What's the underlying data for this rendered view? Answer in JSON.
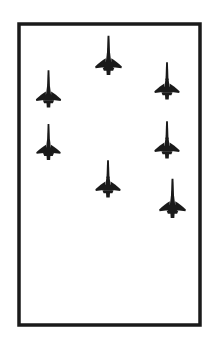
{
  "figure": {
    "description": "Black silhouettes of seven delta-wing interceptor aircraft with long nose probes, all oriented nose-up, arranged in a loose formation inside a rectangular ruled border. The lower portion of the frame is empty white space.",
    "background_color": "#ffffff",
    "ink_color": "#1a1a1a"
  },
  "border": {
    "name": "rectangular-frame",
    "x": 19,
    "y": 24,
    "width": 181,
    "height": 301,
    "stroke_width": 3.5,
    "color": "#1a1a1a"
  },
  "canvas": {
    "width": 219,
    "height": 353
  },
  "aircraft_symbol": {
    "type": "delta-wing-interceptor-silhouette",
    "features": [
      "nose-probe",
      "delta-wing",
      "fuselage",
      "tailplane"
    ],
    "nose_probe_fraction": 0.58,
    "color": "#1a1a1a"
  },
  "aircraft": [
    {
      "id": 1,
      "label": "aircraft-top-center",
      "column": "center",
      "cx": 108.5,
      "cy": 63.0,
      "scale": 1.06,
      "rotation": 0
    },
    {
      "id": 2,
      "label": "aircraft-upper-left",
      "column": "left",
      "cx": 48.5,
      "cy": 96.0,
      "scale": 1.0,
      "rotation": 0
    },
    {
      "id": 3,
      "label": "aircraft-upper-right",
      "column": "right",
      "cx": 167.0,
      "cy": 88.0,
      "scale": 1.0,
      "rotation": 0
    },
    {
      "id": 4,
      "label": "aircraft-lower-left",
      "column": "left",
      "cx": 48.5,
      "cy": 149.0,
      "scale": 0.97,
      "rotation": 0
    },
    {
      "id": 5,
      "label": "aircraft-middle-right",
      "column": "right",
      "cx": 167.0,
      "cy": 147.0,
      "scale": 1.0,
      "rotation": 0
    },
    {
      "id": 6,
      "label": "aircraft-bottom-center",
      "column": "center",
      "cx": 108.0,
      "cy": 186.0,
      "scale": 1.0,
      "rotation": 0
    },
    {
      "id": 7,
      "label": "aircraft-bottom-right",
      "column": "right",
      "cx": 172.5,
      "cy": 206.0,
      "scale": 1.06,
      "rotation": 0
    }
  ],
  "counts": {
    "total_aircraft": 7,
    "left_column": 2,
    "center_column": 2,
    "right_column": 3
  }
}
